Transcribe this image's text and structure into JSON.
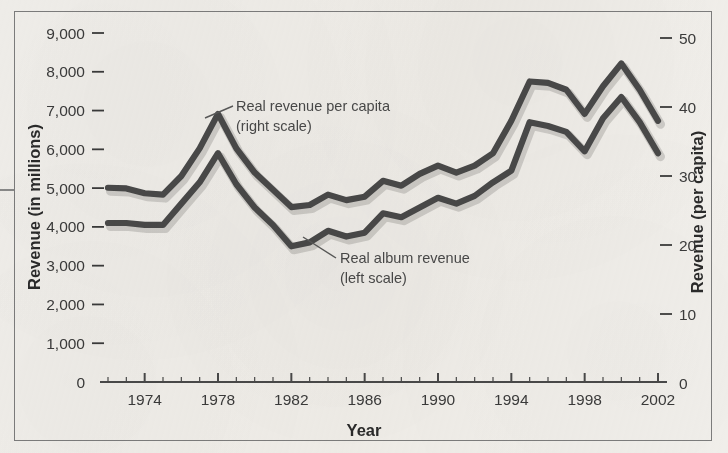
{
  "figure": {
    "background_color": "#f2f0ec",
    "frame_color": "#7d7d7d",
    "line_color": "#4a4a4a",
    "shadow_color": "#cfcdc9"
  },
  "chart_data": {
    "type": "line",
    "title": "",
    "xlabel": "Year",
    "ylabel": "Revenue (in millions)",
    "y2label": "Revenue (per capita)",
    "xlim": [
      1972,
      2002
    ],
    "ylim": [
      0,
      9000
    ],
    "y2lim": [
      0,
      50
    ],
    "grid": false,
    "legend": "annotations",
    "x_tick_labels": [
      "1974",
      "1978",
      "1982",
      "1986",
      "1990",
      "1994",
      "1998",
      "2002"
    ],
    "x_major_ticks": [
      1974,
      1978,
      1982,
      1986,
      1990,
      1994,
      1998,
      2002
    ],
    "x_minor_tick_step": 1,
    "y_tick_labels": [
      "0",
      "1,000",
      "2,000",
      "3,000",
      "4,000",
      "5,000",
      "6,000",
      "7,000",
      "8,000",
      "9,000"
    ],
    "y_ticks": [
      0,
      1000,
      2000,
      3000,
      4000,
      5000,
      6000,
      7000,
      8000,
      9000
    ],
    "y2_tick_labels": [
      "0",
      "10",
      "20",
      "30",
      "40",
      "50"
    ],
    "y2_ticks": [
      0,
      10,
      20,
      30,
      40,
      50
    ],
    "x": [
      1972,
      1973,
      1974,
      1975,
      1976,
      1977,
      1978,
      1979,
      1980,
      1981,
      1982,
      1983,
      1984,
      1985,
      1986,
      1987,
      1988,
      1989,
      1990,
      1991,
      1992,
      1993,
      1994,
      1995,
      1996,
      1997,
      1998,
      1999,
      2000,
      2001,
      2002
    ],
    "series": [
      {
        "name": "Real revenue per capita (right scale)",
        "axis": "right",
        "units": "per capita dollars",
        "values": [
          28.3,
          28.2,
          27.5,
          27.3,
          30.0,
          34.0,
          39.0,
          34.0,
          30.5,
          28.0,
          25.5,
          25.8,
          27.3,
          26.5,
          27.0,
          29.3,
          28.6,
          30.3,
          31.5,
          30.5,
          31.5,
          33.3,
          38.0,
          43.7,
          43.5,
          42.5,
          39.0,
          43.0,
          46.3,
          42.5,
          38.0
        ]
      },
      {
        "name": "Real album revenue (left scale)",
        "axis": "left",
        "units": "millions of dollars",
        "values": [
          4100,
          4100,
          4050,
          4050,
          4600,
          5150,
          5900,
          5100,
          4500,
          4050,
          3500,
          3600,
          3900,
          3750,
          3850,
          4350,
          4250,
          4500,
          4750,
          4600,
          4800,
          5150,
          5450,
          6700,
          6600,
          6450,
          5950,
          6800,
          7350,
          6700,
          5900
        ]
      }
    ],
    "annotations": [
      {
        "id": "annotation-right-scale",
        "line1": "Real revenue per capita",
        "line2": "(right scale)",
        "points_to_year": 1978
      },
      {
        "id": "annotation-left-scale",
        "line1": "Real album revenue",
        "line2": "(left scale)",
        "points_to_year": 1982
      }
    ]
  }
}
